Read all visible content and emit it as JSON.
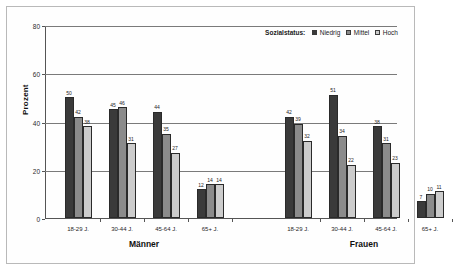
{
  "chart_data": {
    "type": "bar",
    "title": "",
    "xlabel": "",
    "ylabel": "Prozent",
    "ylim": [
      0,
      80
    ],
    "yticks": [
      0,
      20,
      40,
      60,
      80
    ],
    "grid": true,
    "legend_position": "top-right",
    "legend_title": "Sozialstatus:",
    "panels": [
      {
        "name": "Männer"
      },
      {
        "name": "Frauen"
      }
    ],
    "categories": [
      "18-29 J.",
      "30-44 J.",
      "45-64 J.",
      "65+ J."
    ],
    "series": [
      {
        "name": "Niedrig",
        "color": "#3a3a3a",
        "values_maenner": [
          50,
          45,
          44,
          12
        ],
        "values_frauen": [
          42,
          51,
          38,
          7
        ]
      },
      {
        "name": "Mittel",
        "color": "#8b8b8b",
        "values_frauen": [
          39,
          34,
          31,
          10
        ],
        "values_maenner": [
          42,
          46,
          35,
          14
        ]
      },
      {
        "name": "Hoch",
        "color": "#cccccc",
        "values_maenner": [
          38,
          31,
          27,
          14
        ],
        "values_frauen": [
          32,
          22,
          23,
          11
        ]
      }
    ]
  },
  "axis": {
    "y_label": "Prozent",
    "y_ticks": [
      "80",
      "60",
      "40",
      "20",
      "0"
    ]
  },
  "legend": {
    "title": "Sozialstatus:",
    "items": [
      {
        "label": "Niedrig",
        "color": "#3a3a3a"
      },
      {
        "label": "Mittel",
        "color": "#8b8b8b"
      },
      {
        "label": "Hoch",
        "color": "#cccccc"
      }
    ]
  },
  "panels": [
    {
      "name": "Männer",
      "groups": [
        {
          "label": "18-29 J.",
          "bars": [
            {
              "series": "Niedrig",
              "value": 50
            },
            {
              "series": "Mittel",
              "value": 42
            },
            {
              "series": "Hoch",
              "value": 38
            }
          ]
        },
        {
          "label": "30-44 J.",
          "bars": [
            {
              "series": "Niedrig",
              "value": 45
            },
            {
              "series": "Mittel",
              "value": 46
            },
            {
              "series": "Hoch",
              "value": 31
            }
          ]
        },
        {
          "label": "45-64 J.",
          "bars": [
            {
              "series": "Niedrig",
              "value": 44
            },
            {
              "series": "Mittel",
              "value": 35
            },
            {
              "series": "Hoch",
              "value": 27
            }
          ]
        },
        {
          "label": "65+ J.",
          "bars": [
            {
              "series": "Niedrig",
              "value": 12
            },
            {
              "series": "Mittel",
              "value": 14
            },
            {
              "series": "Hoch",
              "value": 14
            }
          ]
        }
      ]
    },
    {
      "name": "Frauen",
      "groups": [
        {
          "label": "18-29 J.",
          "bars": [
            {
              "series": "Niedrig",
              "value": 42
            },
            {
              "series": "Mittel",
              "value": 39
            },
            {
              "series": "Hoch",
              "value": 32
            }
          ]
        },
        {
          "label": "30-44 J.",
          "bars": [
            {
              "series": "Niedrig",
              "value": 51
            },
            {
              "series": "Mittel",
              "value": 34
            },
            {
              "series": "Hoch",
              "value": 22
            }
          ]
        },
        {
          "label": "45-64 J.",
          "bars": [
            {
              "series": "Niedrig",
              "value": 38
            },
            {
              "series": "Mittel",
              "value": 31
            },
            {
              "series": "Hoch",
              "value": 23
            }
          ]
        },
        {
          "label": "65+ J.",
          "bars": [
            {
              "series": "Niedrig",
              "value": 7
            },
            {
              "series": "Mittel",
              "value": 10
            },
            {
              "series": "Hoch",
              "value": 11
            }
          ]
        }
      ]
    }
  ]
}
